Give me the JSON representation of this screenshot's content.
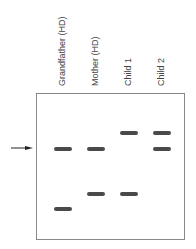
{
  "lanes": [
    {
      "label": "Grandfather (HD)"
    },
    {
      "label": "Mother (HD)"
    },
    {
      "label": "Child 1"
    },
    {
      "label": "Child 2"
    }
  ],
  "bands": {
    "grandfather": [
      "row2",
      "row4"
    ],
    "mother": [
      "row2",
      "row3"
    ],
    "child1": [
      "row1",
      "row3"
    ],
    "child2": [
      "row1",
      "row2"
    ]
  },
  "arrow": {
    "points_to": "row2"
  }
}
